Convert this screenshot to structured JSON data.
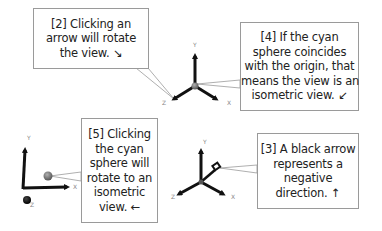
{
  "callouts": [
    {
      "id": "2",
      "lines": [
        "[2] Clicking an",
        "arrow will rotate",
        "the view.  ↘"
      ],
      "box": {
        "x": 33,
        "y": 8,
        "w": 116,
        "h": 61
      }
    },
    {
      "id": "4",
      "lines": [
        "[4] If the cyan",
        "sphere coincides",
        "with the origin, that",
        "means the view is an",
        "isometric view.  ↙"
      ],
      "box": {
        "x": 240,
        "y": 22,
        "w": 119,
        "h": 89
      }
    },
    {
      "id": "5",
      "lines": [
        "[5] Clicking",
        "the cyan",
        "sphere will",
        "rotate to an",
        "isometric",
        "view.  ←"
      ],
      "box": {
        "x": 81,
        "y": 118,
        "w": 77,
        "h": 105
      }
    },
    {
      "id": "3",
      "lines": [
        "[3] A black arrow",
        "represents a",
        "negative",
        "direction.  ↑"
      ],
      "box": {
        "x": 257,
        "y": 133,
        "w": 102,
        "h": 76
      }
    }
  ],
  "gizmos": [
    {
      "name": "isometric-gizmo",
      "axis_labels": {
        "x": "X",
        "y": "Y",
        "z": "Z"
      }
    },
    {
      "name": "front-view-gizmo",
      "axis_labels": {
        "x": "X",
        "y": "Y",
        "z": "Z"
      }
    },
    {
      "name": "negative-arrow-gizmo",
      "axis_labels": {
        "x": "X",
        "y": "Y",
        "z": "Z"
      }
    }
  ],
  "colors": {
    "arrow": "#111111",
    "origin_sphere": "#7f7f7f",
    "border": "#9a9a9a",
    "label": "#888888"
  }
}
